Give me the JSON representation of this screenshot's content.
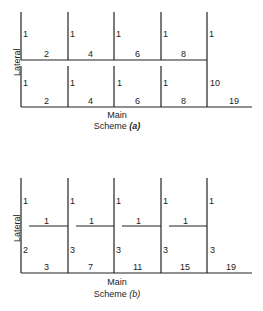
{
  "scheme_a": {
    "axis_lateral": "Lateral",
    "axis_main": "Main",
    "caption_prefix": "Scheme ",
    "caption_letter": "(a)",
    "upper_row": {
      "lateral": [
        "1",
        "1",
        "1",
        "1",
        "1"
      ],
      "main": [
        "2",
        "4",
        "6",
        "8"
      ]
    },
    "lower_row": {
      "lateral": [
        "1",
        "1",
        "1",
        "1",
        "10"
      ],
      "main": [
        "2",
        "4",
        "6",
        "8",
        "19"
      ]
    }
  },
  "scheme_b": {
    "axis_lateral": "Lateral",
    "axis_main": "Main",
    "caption_prefix": "Scheme ",
    "caption_letter": "(b)",
    "top_lateral": [
      "1",
      "1",
      "1",
      "1",
      "1"
    ],
    "branch": [
      "1",
      "1",
      "1",
      "1"
    ],
    "lower_lateral": [
      "2",
      "3",
      "3",
      "3",
      "3"
    ],
    "main": [
      "3",
      "7",
      "11",
      "15",
      "19"
    ]
  }
}
